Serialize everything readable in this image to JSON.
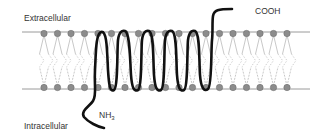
{
  "diagram": {
    "labels": {
      "extracellular": "Extracellular",
      "intracellular": "Intracellular",
      "c_terminus": "COOH",
      "n_terminus_main": "NH",
      "n_terminus_sub": "3"
    },
    "membrane": {
      "upper_line_y": 32,
      "lower_line_y": 89,
      "line_x_start": 22,
      "line_x_end": 310,
      "line_color": "#9a9a9a",
      "head_color": "#8c8c8c",
      "head_stroke": "#6a6a6a",
      "tail_color": "#b0b0b0",
      "head_count": 19,
      "head_x_start": 44,
      "head_spacing": 13.5,
      "head_radius": 3.2
    },
    "helix": {
      "color": "#111111",
      "turns": 6,
      "orientation": "N-terminus intracellular, C-terminus extracellular"
    }
  }
}
